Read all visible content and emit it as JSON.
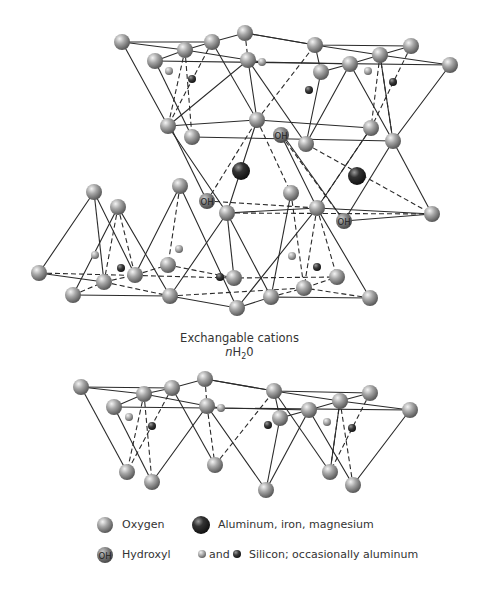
{
  "diagram": {
    "interlayer_caption_line1": "Exchangable cations",
    "interlayer_caption_line2_italic": "n",
    "interlayer_caption_line2_rest": "H",
    "interlayer_caption_sub": "2",
    "interlayer_caption_end": "0",
    "colors": {
      "oxygen": "#9a9a9a",
      "metal": "#2e2e2e",
      "silicon_light": "#a8a8a8",
      "silicon_dark": "#3a3a3a",
      "line": "#2a2a2a"
    }
  },
  "legend": {
    "oxygen": "Oxygen",
    "metal": "Aluminum, iron, magnesium",
    "hydroxyl_symbol": "OH",
    "hydroxyl": "Hydroxyl",
    "and": "and",
    "silicon": "Silicon; occasionally aluminum"
  },
  "oh_label": "OH"
}
